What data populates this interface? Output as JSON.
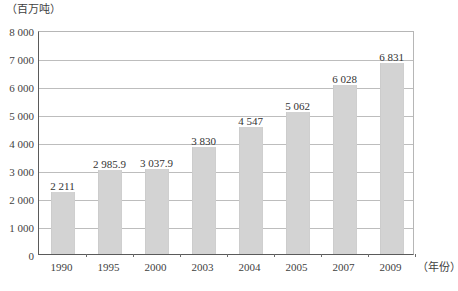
{
  "chart_data": {
    "type": "bar",
    "title": "",
    "subtitle": "",
    "xlabel": "（年份）",
    "ylabel": "（百万吨）",
    "categories": [
      "1990",
      "1995",
      "2000",
      "2003",
      "2004",
      "2005",
      "2007",
      "2009"
    ],
    "values": [
      2211,
      2985.9,
      3037.9,
      3830,
      4547,
      5062,
      6028,
      6831
    ],
    "value_labels": [
      "2 211",
      "2 985.9",
      "3 037.9",
      "3 830",
      "4 547",
      "5 062",
      "6 028",
      "6 831"
    ],
    "ylim": [
      0,
      8000
    ],
    "ytick_values": [
      0,
      1000,
      2000,
      3000,
      4000,
      5000,
      6000,
      7000,
      8000
    ],
    "ytick_labels": [
      "0",
      "1 000",
      "2 000",
      "3 000",
      "4 000",
      "5 000",
      "6 000",
      "7 000",
      "8 000"
    ],
    "grid": true,
    "legend": false,
    "legend_position": "none",
    "series": [
      {
        "name": "产量",
        "values": [
          2211,
          2985.9,
          3037.9,
          3830,
          4547,
          5062,
          6028,
          6831
        ]
      }
    ],
    "colors": {
      "bar_fill": "#d3d3d3",
      "gridline": "#bdbdbd",
      "axis": "#5a5a5a",
      "text": "#3f3f3f"
    }
  }
}
